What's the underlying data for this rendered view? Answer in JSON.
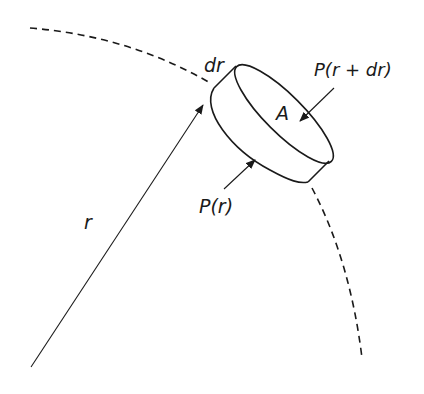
{
  "diagram": {
    "title": "",
    "labels": {
      "radius": "r",
      "thickness": "dr",
      "area": "A",
      "pressure_inner": "P(r)",
      "pressure_outer": "P(r + dr)"
    },
    "elements": [
      {
        "type": "dashed-arc",
        "description": "boundary arc of sphere/star"
      },
      {
        "type": "arrow",
        "description": "radius vector from center to shell",
        "label": "r"
      },
      {
        "type": "cylinder",
        "description": "thin gas element of thickness dr and cross-section area A"
      },
      {
        "type": "arrow",
        "description": "pressure acting on inner face",
        "label": "P(r)"
      },
      {
        "type": "arrow",
        "description": "pressure acting on outer face",
        "label": "P(r + dr)"
      }
    ],
    "colors": {
      "line": "#1a1a1a",
      "background": "#ffffff"
    }
  }
}
